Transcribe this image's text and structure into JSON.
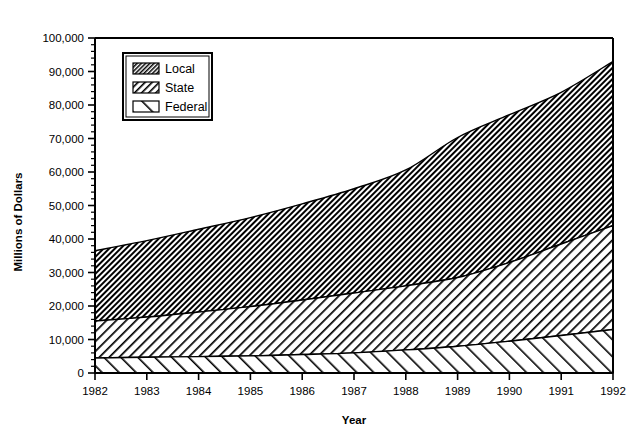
{
  "chart_data": {
    "type": "area",
    "title": "",
    "xlabel": "Year",
    "ylabel": "Millions of Dollars",
    "stacked": true,
    "grid": false,
    "legend_position": "top-left-inside",
    "x": [
      1982,
      1983,
      1984,
      1985,
      1986,
      1987,
      1988,
      1989,
      1990,
      1991,
      1992
    ],
    "categories": [
      "1982",
      "1983",
      "1984",
      "1985",
      "1986",
      "1987",
      "1988",
      "1989",
      "1990",
      "1991",
      "1992"
    ],
    "xlim": [
      1982,
      1992
    ],
    "ylim": [
      0,
      100000
    ],
    "ytick_values": [
      0,
      10000,
      20000,
      30000,
      40000,
      50000,
      60000,
      70000,
      80000,
      90000,
      100000
    ],
    "ytick_labels": [
      "0",
      "10,000",
      "20,000",
      "30,000",
      "40,000",
      "50,000",
      "60,000",
      "70,000",
      "80,000",
      "90,000",
      "100,000"
    ],
    "yminor_interval": 2000,
    "series": [
      {
        "name": "Federal",
        "pattern": "sparse-diagonal-backslash",
        "values": [
          4500,
          4700,
          4900,
          5100,
          5500,
          6000,
          6900,
          8000,
          9500,
          11200,
          13000
        ]
      },
      {
        "name": "State",
        "pattern": "medium-diagonal-slash",
        "values": [
          11000,
          12000,
          13300,
          14700,
          16300,
          17900,
          19100,
          20500,
          23500,
          27300,
          31000
        ]
      },
      {
        "name": "Local",
        "pattern": "dense-diagonal-hatch",
        "values": [
          21000,
          22800,
          24700,
          26600,
          28700,
          31100,
          34600,
          41800,
          44100,
          45300,
          49000
        ]
      }
    ],
    "cumulative_totals": {
      "federal_top": [
        4500,
        4700,
        4900,
        5100,
        5500,
        6000,
        6900,
        8000,
        9500,
        11200,
        13000
      ],
      "state_top": [
        15500,
        16700,
        18200,
        19800,
        21800,
        23900,
        26000,
        28500,
        33000,
        38500,
        44000
      ],
      "local_top": [
        36500,
        39500,
        42900,
        46400,
        50500,
        55000,
        60600,
        70300,
        77100,
        83800,
        93000
      ]
    }
  },
  "legend": {
    "items": [
      {
        "label": "Local",
        "swatch": "dense-diagonal-hatch"
      },
      {
        "label": "State",
        "swatch": "medium-diagonal-slash"
      },
      {
        "label": "Federal",
        "swatch": "sparse-diagonal-backslash"
      }
    ]
  },
  "colors": {
    "axis": "#000000",
    "plot_background": "#ffffff",
    "hatch": "#000000"
  }
}
